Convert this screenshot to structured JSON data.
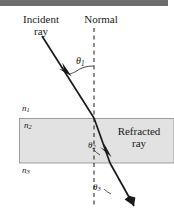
{
  "figure": {
    "title_bar": {
      "name": "top-rule",
      "color": "#6e6e6e"
    },
    "background_color": "#ffffff",
    "ink_color": "#1a1a1a",
    "slab_fill_color": "#e2e2e2",
    "slab_border_color": "#808080",
    "labels": {
      "incident_ray": "Incident\nray",
      "incident_ray_line1": "Incident",
      "incident_ray_line2": "ray",
      "normal": "Normal",
      "refracted_ray_line1": "Refracted",
      "refracted_ray_line2": "ray",
      "n1": "n",
      "n1_sub": "1",
      "n2": "n",
      "n2_sub": "2",
      "n3": "n",
      "n3_sub": "3",
      "theta1": "θ",
      "theta1_sub": "1",
      "theta2": "θ",
      "theta2_sub": "2",
      "theta3": "θ",
      "theta3_sub": "3"
    },
    "geometry": {
      "normal_line_x": 94,
      "normal_line_y_top": 28,
      "normal_line_y_bottom": 208,
      "slab_left": 19,
      "slab_right": 174,
      "slab_top": 118,
      "slab_bottom": 163,
      "incident_start_x": 42,
      "incident_start_y": 36,
      "interface1_x": 94,
      "interface1_y": 118,
      "interface2_x": 110,
      "interface2_y": 163,
      "exit_end_x": 134,
      "exit_end_y": 206
    }
  }
}
